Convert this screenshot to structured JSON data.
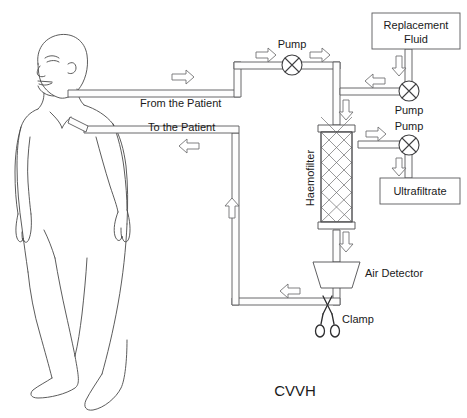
{
  "diagram": {
    "title": "CVVH",
    "labels": {
      "from_patient": "From the Patient",
      "to_patient": "To the Patient",
      "pump_blood": "Pump",
      "pump_replacement": "Pump",
      "pump_ultrafiltrate": "Pump",
      "replacement_fluid": "Replacement",
      "replacement_fluid_2": "Fluid",
      "ultrafiltrate": "Ultrafiltrate",
      "haemofilter": "Haemofilter",
      "air_detector": "Air Detector",
      "clamp": "Clamp"
    },
    "colors": {
      "background": "#ffffff",
      "line": "#58585a",
      "text": "#1a1a1a",
      "arrow_outline": "#6b6b6d",
      "body_outline": "#4a4a4a"
    },
    "flow_arrows": [
      {
        "name": "arterial-outflow",
        "direction": "right"
      },
      {
        "name": "post-pump-blood",
        "direction": "right"
      },
      {
        "name": "pre-pump-blood",
        "direction": "right"
      },
      {
        "name": "into-haemofilter",
        "direction": "down"
      },
      {
        "name": "replacement-fluid-down",
        "direction": "down"
      },
      {
        "name": "replacement-into-line",
        "direction": "left"
      },
      {
        "name": "ultrafiltrate-out",
        "direction": "right"
      },
      {
        "name": "ultrafiltrate-down",
        "direction": "down"
      },
      {
        "name": "filter-outlet-down",
        "direction": "down"
      },
      {
        "name": "venous-return-left",
        "direction": "left"
      },
      {
        "name": "venous-return-up",
        "direction": "up"
      },
      {
        "name": "venous-to-patient",
        "direction": "left"
      }
    ]
  }
}
